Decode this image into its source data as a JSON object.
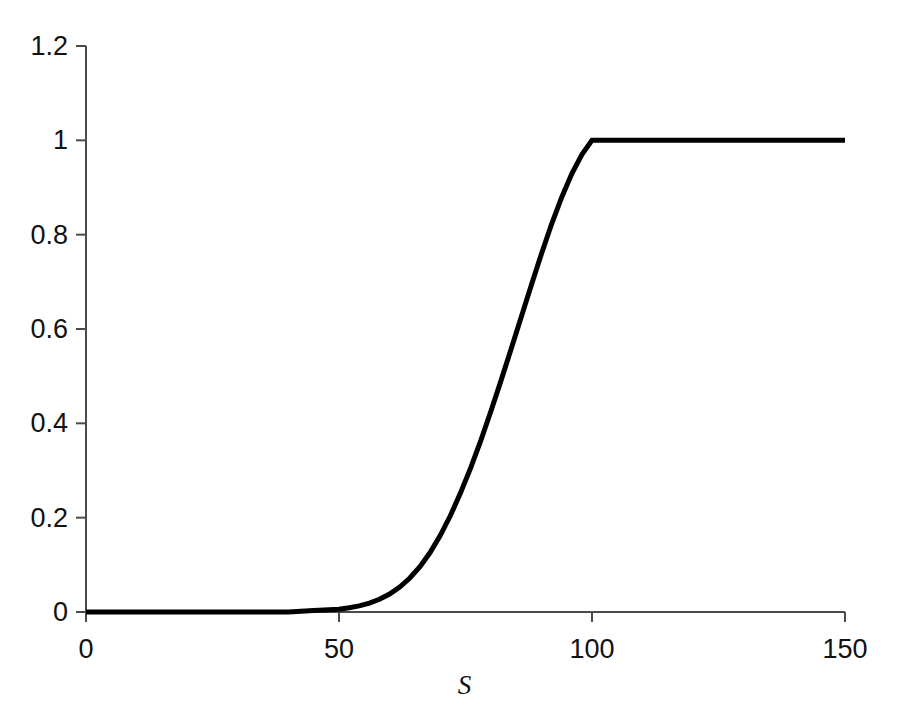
{
  "chart_data": {
    "type": "line",
    "title": "",
    "subtitle": "",
    "xlabel": "S",
    "ylabel": "",
    "xlim": [
      0,
      150
    ],
    "ylim": [
      0,
      1.2
    ],
    "xticks": [
      0,
      50,
      100,
      150
    ],
    "xtick_labels": [
      "0",
      "50",
      "100",
      "150"
    ],
    "yticks": [
      0,
      0.2,
      0.4,
      0.6,
      0.8,
      1,
      1.2
    ],
    "ytick_labels": [
      "0",
      "0.2",
      "0.4",
      "0.6",
      "0.8",
      "1",
      "1.2"
    ],
    "grid": false,
    "legend": null,
    "annotations": [],
    "series": [
      {
        "name": "curve",
        "color": "#000000",
        "line_width": 5,
        "x": [
          0,
          5,
          10,
          15,
          20,
          25,
          30,
          35,
          40,
          45,
          50,
          52,
          54,
          56,
          58,
          60,
          62,
          64,
          66,
          68,
          70,
          72,
          74,
          76,
          78,
          80,
          82,
          84,
          86,
          88,
          90,
          92,
          94,
          96,
          98,
          100,
          105,
          110,
          115,
          120,
          125,
          130,
          135,
          140,
          145,
          150
        ],
        "y": [
          0,
          0,
          0,
          0,
          0,
          0,
          0,
          0,
          0,
          0.003,
          0.006,
          0.009,
          0.013,
          0.019,
          0.027,
          0.038,
          0.053,
          0.072,
          0.096,
          0.126,
          0.162,
          0.204,
          0.252,
          0.305,
          0.363,
          0.425,
          0.49,
          0.557,
          0.625,
          0.693,
          0.759,
          0.822,
          0.879,
          0.929,
          0.97,
          1,
          1,
          1,
          1,
          1,
          1,
          1,
          1,
          1,
          1,
          1
        ]
      }
    ]
  },
  "axes": {
    "axis_color": "#4a4a4a",
    "tick_color": "#4a4a4a",
    "background": "#ffffff"
  }
}
